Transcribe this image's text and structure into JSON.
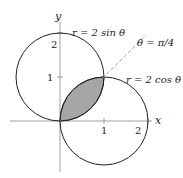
{
  "diagram": {
    "axes": {
      "x_label": "x",
      "y_label": "y",
      "x_ticks": [
        "1",
        "2"
      ],
      "y_ticks": [
        "1",
        "2"
      ]
    },
    "curves": [
      {
        "label": "r = 2 sin θ",
        "type": "circle",
        "center": [
          0,
          1
        ],
        "radius": 1
      },
      {
        "label": "r = 2 cos θ",
        "type": "circle",
        "center": [
          1,
          0
        ],
        "radius": 1
      }
    ],
    "line": {
      "label": "θ = π/4",
      "style": "dashed"
    },
    "shaded_region": {
      "description": "intersection of the two circles",
      "color": "#a6a6a6"
    }
  }
}
